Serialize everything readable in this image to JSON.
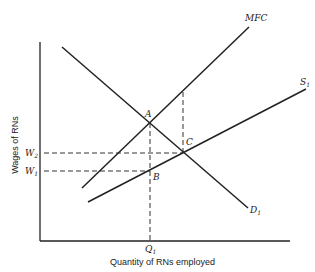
{
  "diagram": {
    "type": "monopsony labor market",
    "axes": {
      "ylabel": "Wages of RNs",
      "xlabel": "Quantity of RNs employed"
    },
    "curves": [
      {
        "name": "MFC",
        "label": "MFC"
      },
      {
        "name": "S",
        "label": "S",
        "sub": "1"
      },
      {
        "name": "D",
        "label": "D",
        "sub": "1"
      }
    ],
    "points": [
      {
        "name": "A",
        "label": "A"
      },
      {
        "name": "B",
        "label": "B"
      },
      {
        "name": "C",
        "label": "C"
      }
    ],
    "ticks": {
      "w2": {
        "label": "W",
        "sub": "2"
      },
      "w1": {
        "label": "W",
        "sub": "1"
      },
      "q1": {
        "label": "Q",
        "sub": "1"
      }
    }
  }
}
